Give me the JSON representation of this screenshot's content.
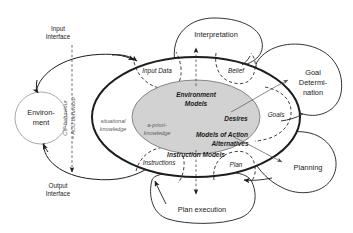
{
  "figure": {
    "title_cut_off": "",
    "background_color": "#ffffff",
    "core_fill_color": "#d2d2d2",
    "outline_color": "#1d1d1d"
  },
  "environment": {
    "label_line1": "Environ-",
    "label_line2": "ment"
  },
  "interfaces": {
    "input_line1": "Input",
    "input_line2": "Interface",
    "output_line1": "Output",
    "output_line2": "Interface",
    "behaviour_line1": "CIP behaviour",
    "behaviour_line2": "= ACU behaviour"
  },
  "knowledge": {
    "situational_line1": "situational",
    "situational_line2": "knowledge",
    "apriori_line1": "a-priori-",
    "apriori_line2": "knowledge"
  },
  "core_models": {
    "environment_models_line1": "Environment",
    "environment_models_line2": "Models",
    "desires": "Desires",
    "action_alternatives_line1": "Models of Action",
    "action_alternatives_line2": "Alternatives",
    "instruction_models": "Instruction Models"
  },
  "dashed_regions": [
    {
      "id": "input-data",
      "label": "Input Data"
    },
    {
      "id": "belief",
      "label": "Belief"
    },
    {
      "id": "goals",
      "label": "Goals"
    },
    {
      "id": "plan",
      "label": "Plan"
    },
    {
      "id": "instructions",
      "label": "Instructions"
    }
  ],
  "processes": {
    "interpretation": "Interpretation",
    "goal_determination_line1": "Goal",
    "goal_determination_line2": "Determi-",
    "goal_determination_line3": "nation",
    "planning": "Planning",
    "plan_execution": "Plan execution"
  }
}
